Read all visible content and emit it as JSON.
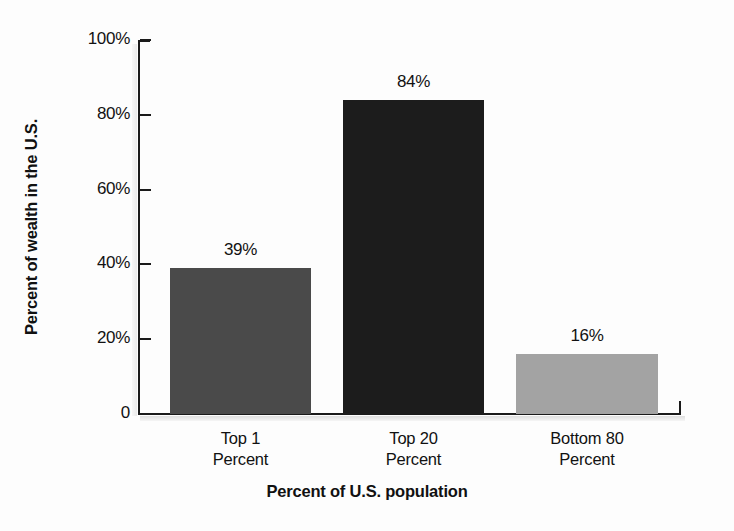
{
  "chart_data": {
    "type": "bar",
    "title": "",
    "xlabel": "Percent of U.S. population",
    "ylabel": "Percent of wealth in the U.S.",
    "categories": [
      "Top 1 Percent",
      "Top 20 Percent",
      "Bottom 80 Percent"
    ],
    "category_lines": [
      [
        "Top 1",
        "Percent"
      ],
      [
        "Top 20",
        "Percent"
      ],
      [
        "Bottom 80",
        "Percent"
      ]
    ],
    "values": [
      39,
      84,
      16
    ],
    "value_labels": [
      "39%",
      "84%",
      "16%"
    ],
    "ylim": [
      0,
      100
    ],
    "yticks": [
      0,
      20,
      40,
      60,
      80,
      100
    ],
    "ytick_labels": [
      "0",
      "20%",
      "40%",
      "60%",
      "80%",
      "100%"
    ],
    "grid": false,
    "legend": false,
    "bar_colors": [
      "#4a4a4a",
      "#1c1c1c",
      "#a3a3a3"
    ],
    "axis_color": "#1a1a1a",
    "background_color": "#fdfdfd"
  }
}
